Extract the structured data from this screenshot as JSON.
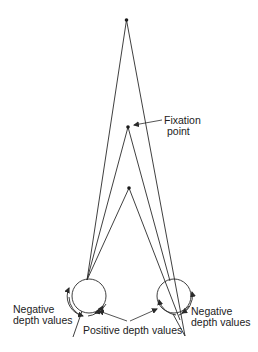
{
  "labels": {
    "fixation": [
      "Fixation",
      "point"
    ],
    "negative_left": [
      "Negative",
      "depth values"
    ],
    "negative_right": [
      "Negative",
      "depth values"
    ],
    "positive": "Positive depth values"
  },
  "points": {
    "far": {
      "x": 126.5,
      "y": 20
    },
    "fixation": {
      "x": 128,
      "y": 127
    },
    "near": {
      "x": 129,
      "y": 188
    }
  },
  "eyes": {
    "left": {
      "cx": 89,
      "cy": 296,
      "r": 17
    },
    "right": {
      "cx": 174,
      "cy": 296,
      "r": 17
    }
  },
  "colors": {
    "line": "#2a2a2a",
    "text": "#222222"
  }
}
